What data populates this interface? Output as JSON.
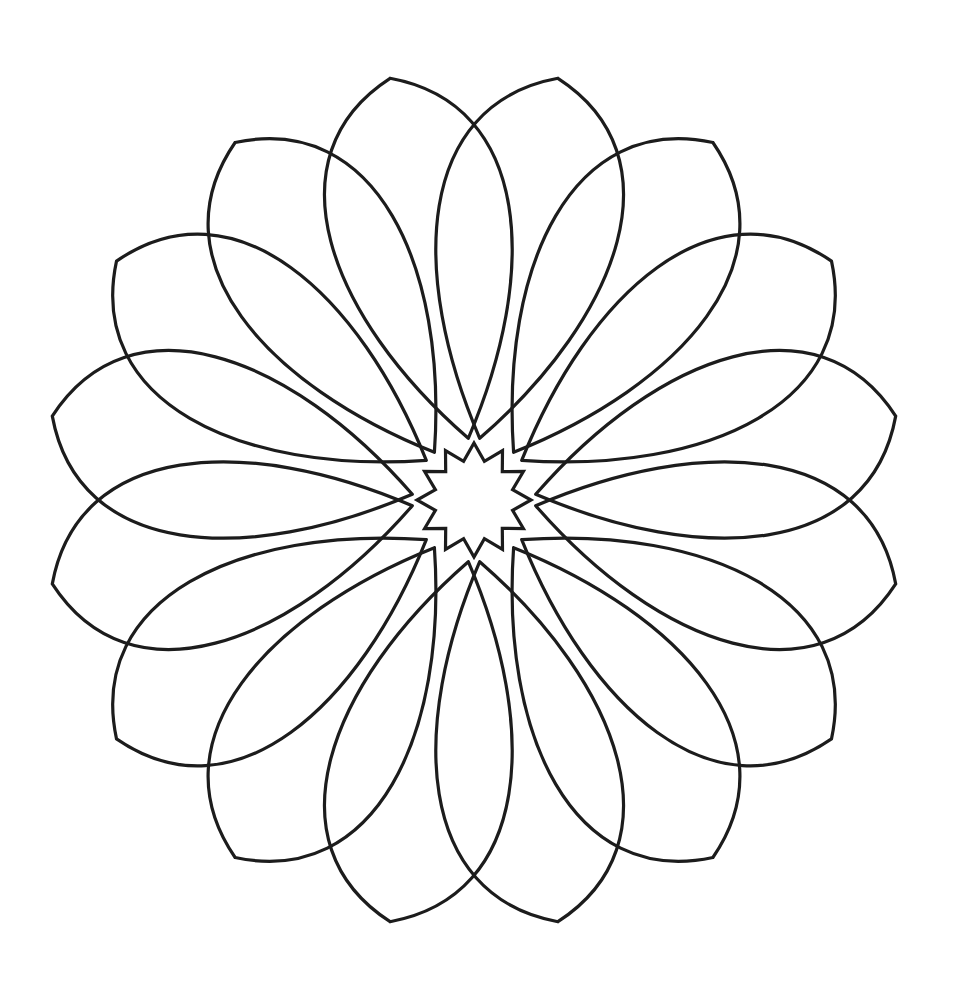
{
  "artwork": {
    "type": "mandala-coloring-page",
    "stroke_color": "#1c1c1c",
    "background": "#ffffff",
    "center": [
      474,
      500
    ],
    "heart_count": 8,
    "loop_outer_radius": 430,
    "loop_inner_radius": 62,
    "loop_half_width_deg": 26,
    "loop_axis_offset_deg": 11,
    "inner_tip_offset_deg": 6,
    "star": {
      "points": 12,
      "outer_radius": 57,
      "inner_radius": 40
    }
  }
}
